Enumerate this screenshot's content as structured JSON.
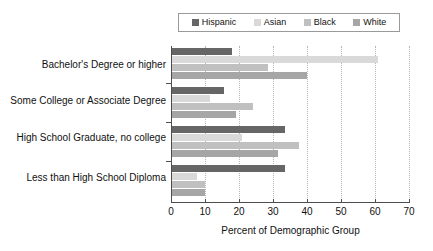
{
  "chart_data": {
    "type": "bar",
    "orientation": "horizontal",
    "title": "",
    "xlabel": "Percent of Demographic Group",
    "ylabel": "",
    "xlim": [
      0,
      70
    ],
    "xticks": [
      0,
      10,
      20,
      30,
      40,
      50,
      60,
      70
    ],
    "xtick_labels": [
      "0",
      "10",
      "20",
      "30",
      "40",
      "50",
      "60",
      "70"
    ],
    "grid": "vertical-dotted",
    "legend_position": "top",
    "categories": [
      "Bachelor's Degree or higher",
      "Some College or Associate Degree",
      "High School Graduate, no college",
      "Less than High School Diploma"
    ],
    "series": [
      {
        "name": "Hispanic",
        "color": "#666666",
        "values": [
          18,
          15.5,
          33.5,
          33.5
        ]
      },
      {
        "name": "Asian",
        "color": "#d9d9d9",
        "values": [
          61,
          11.5,
          21,
          7.5
        ]
      },
      {
        "name": "Black",
        "color": "#c0c0c0",
        "values": [
          28.5,
          24,
          37.5,
          10
        ]
      },
      {
        "name": "White",
        "color": "#a6a6a6",
        "values": [
          40,
          19,
          31.5,
          10
        ]
      }
    ]
  },
  "legend": {
    "items": [
      {
        "label": "Hispanic",
        "color": "#666666"
      },
      {
        "label": "Asian",
        "color": "#d9d9d9"
      },
      {
        "label": "Black",
        "color": "#c0c0c0"
      },
      {
        "label": "White",
        "color": "#a6a6a6"
      }
    ]
  },
  "axis": {
    "x_title": "Percent of Demographic Group"
  }
}
